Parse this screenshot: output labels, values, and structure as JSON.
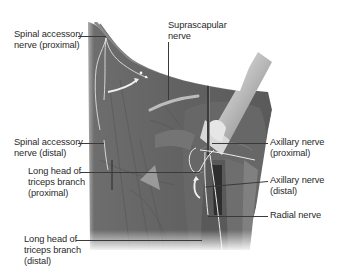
{
  "figure": {
    "colors": {
      "background": "#ffffff",
      "muscle_dark": "#5a5a5a",
      "muscle_mid": "#757575",
      "muscle_light": "#9a9a9a",
      "nerve": "#e8e8e8",
      "label_text": "#2a2a2a",
      "leader_line": "#3a3a3a"
    },
    "labels": {
      "spinal_accessory_proximal": "Spinal accessory\nnerve (proximal)",
      "suprascapular": "Suprascapular\nnerve",
      "spinal_accessory_distal": "Spinal accessory\nnerve (distal)",
      "long_head_triceps_proximal": "Long head of\ntriceps branch\n(proximal)",
      "long_head_triceps_distal": "Long head of\ntriceps branch\n(distal)",
      "axillary_proximal": "Axillary nerve\n(proximal)",
      "axillary_distal": "Axillary nerve\n(distal)",
      "radial": "Radial nerve"
    }
  }
}
